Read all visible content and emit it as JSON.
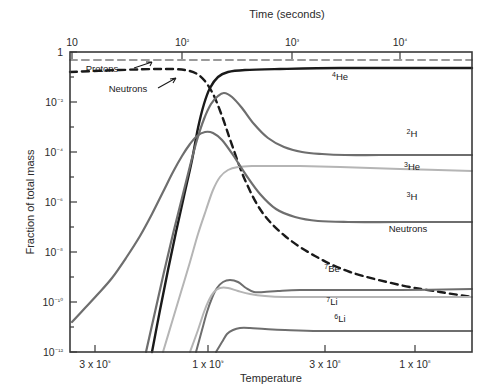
{
  "chart_data": {
    "type": "line",
    "title": "",
    "xlabel": "Temperature",
    "ylabel": "Fraction of total mass",
    "top_axis_label": "Time (seconds)",
    "grid": false,
    "legend": "inline-labels",
    "x_axis": {
      "scale": "log-reversed",
      "tick_labels": [
        "3 x 10⁹",
        "1 x 10⁹",
        "3 x 10⁸",
        "1 x 10⁸"
      ],
      "tick_values": [
        3000000000.0,
        1000000000.0,
        300000000.0,
        100000000.0
      ],
      "tick_px": [
        95,
        208,
        325,
        415
      ]
    },
    "top_axis": {
      "scale": "log",
      "tick_labels": [
        "10",
        "10²",
        "10³",
        "10⁴"
      ],
      "tick_values": [
        10,
        100,
        1000,
        10000
      ],
      "tick_px": [
        72,
        182,
        292,
        400
      ]
    },
    "y_axis": {
      "scale": "log",
      "tick_labels": [
        "1",
        "10⁻²",
        "10⁻⁴",
        "10⁻⁶",
        "10⁻⁸",
        "10⁻¹⁰",
        "10⁻¹²"
      ],
      "tick_values": [
        1,
        0.01,
        0.0001,
        1e-06,
        1e-08,
        1e-10,
        1e-12
      ],
      "ylim": [
        1e-12,
        1
      ]
    },
    "series": [
      {
        "name": "Protons",
        "label": "Protons",
        "color": "#9a9a9a",
        "style": "dashed",
        "width": 2.0,
        "final_value": 0.75,
        "points": [
          [
            0,
            60
          ],
          [
            492,
            60
          ]
        ]
      },
      {
        "name": "Neutrons",
        "label": "Neutrons",
        "color": "#1a1a1a",
        "style": "dashed",
        "width": 2.4,
        "final_value": 1e-10,
        "points": [
          [
            70,
            72
          ],
          [
            120,
            70
          ],
          [
            160,
            69
          ],
          [
            185,
            70
          ],
          [
            200,
            76
          ],
          [
            212,
            92
          ],
          [
            222,
            116
          ],
          [
            232,
            145
          ],
          [
            245,
            180
          ],
          [
            262,
            212
          ],
          [
            285,
            236
          ],
          [
            315,
            256
          ],
          [
            350,
            272
          ],
          [
            400,
            285
          ],
          [
            440,
            292
          ],
          [
            472,
            297
          ]
        ]
      },
      {
        "name": "4He",
        "label": "⁴He",
        "color": "#1a1a1a",
        "style": "solid",
        "width": 2.4,
        "final_value": 0.25,
        "points": [
          [
            152,
            352
          ],
          [
            160,
            310
          ],
          [
            168,
            270
          ],
          [
            176,
            232
          ],
          [
            184,
            196
          ],
          [
            192,
            160
          ],
          [
            198,
            128
          ],
          [
            204,
            104
          ],
          [
            210,
            88
          ],
          [
            218,
            77
          ],
          [
            228,
            72
          ],
          [
            245,
            70
          ],
          [
            280,
            69
          ],
          [
            340,
            68
          ],
          [
            420,
            68
          ],
          [
            472,
            68
          ]
        ]
      },
      {
        "name": "2H",
        "label": "²H",
        "color": "#6e6e6e",
        "style": "solid",
        "width": 2.2,
        "final_value": 3e-05,
        "points": [
          [
            146,
            352
          ],
          [
            155,
            312
          ],
          [
            164,
            272
          ],
          [
            173,
            234
          ],
          [
            182,
            198
          ],
          [
            190,
            166
          ],
          [
            197,
            140
          ],
          [
            204,
            119
          ],
          [
            211,
            104
          ],
          [
            218,
            96
          ],
          [
            224,
            93
          ],
          [
            232,
            97
          ],
          [
            242,
            108
          ],
          [
            254,
            124
          ],
          [
            268,
            138
          ],
          [
            284,
            147
          ],
          [
            302,
            152
          ],
          [
            322,
            154
          ],
          [
            345,
            155
          ],
          [
            380,
            155
          ],
          [
            430,
            155
          ],
          [
            472,
            155
          ]
        ]
      },
      {
        "name": "3He",
        "label": "³He",
        "color": "#b5b5b5",
        "style": "solid",
        "width": 2.0,
        "final_value": 1e-05,
        "points": [
          [
            163,
            352
          ],
          [
            172,
            322
          ],
          [
            181,
            292
          ],
          [
            190,
            262
          ],
          [
            198,
            234
          ],
          [
            206,
            210
          ],
          [
            213,
            190
          ],
          [
            220,
            177
          ],
          [
            228,
            170
          ],
          [
            238,
            167
          ],
          [
            252,
            166
          ],
          [
            272,
            166
          ],
          [
            300,
            166
          ],
          [
            340,
            167
          ],
          [
            400,
            169
          ],
          [
            472,
            171
          ]
        ]
      },
      {
        "name": "3H",
        "label": "³H",
        "color": "#6e6e6e",
        "style": "solid",
        "width": 2.2,
        "final_value": 2e-07,
        "points": [
          [
            72,
            322
          ],
          [
            85,
            308
          ],
          [
            98,
            294
          ],
          [
            112,
            278
          ],
          [
            126,
            258
          ],
          [
            140,
            236
          ],
          [
            152,
            214
          ],
          [
            163,
            192
          ],
          [
            173,
            172
          ],
          [
            182,
            156
          ],
          [
            190,
            144
          ],
          [
            197,
            136
          ],
          [
            205,
            132
          ],
          [
            213,
            133
          ],
          [
            222,
            140
          ],
          [
            233,
            155
          ],
          [
            246,
            175
          ],
          [
            260,
            194
          ],
          [
            276,
            209
          ],
          [
            295,
            217
          ],
          [
            318,
            221
          ],
          [
            348,
            222
          ],
          [
            400,
            222
          ],
          [
            472,
            222
          ]
        ]
      },
      {
        "name": "7Be",
        "label": "⁷Be",
        "color": "#6e6e6e",
        "style": "solid",
        "width": 2.0,
        "final_value": 1e-10,
        "points": [
          [
            196,
            352
          ],
          [
            202,
            330
          ],
          [
            207,
            312
          ],
          [
            212,
            298
          ],
          [
            217,
            288
          ],
          [
            223,
            282
          ],
          [
            230,
            280
          ],
          [
            238,
            282
          ],
          [
            246,
            288
          ],
          [
            254,
            292
          ],
          [
            264,
            292
          ],
          [
            278,
            291
          ],
          [
            300,
            290
          ],
          [
            340,
            290
          ],
          [
            400,
            290
          ],
          [
            472,
            289
          ]
        ]
      },
      {
        "name": "7Li",
        "label": "⁷Li",
        "color": "#b5b5b5",
        "style": "solid",
        "width": 2.0,
        "final_value": 6e-11,
        "points": [
          [
            190,
            352
          ],
          [
            198,
            330
          ],
          [
            204,
            312
          ],
          [
            209,
            300
          ],
          [
            214,
            292
          ],
          [
            220,
            288
          ],
          [
            228,
            288
          ],
          [
            238,
            291
          ],
          [
            250,
            294
          ],
          [
            265,
            296
          ],
          [
            285,
            297
          ],
          [
            320,
            297
          ],
          [
            380,
            297
          ],
          [
            472,
            297
          ]
        ]
      },
      {
        "name": "6Li",
        "label": "⁶Li",
        "color": "#6e6e6e",
        "style": "solid",
        "width": 2.0,
        "final_value": 1e-12,
        "points": [
          [
            216,
            352
          ],
          [
            222,
            342
          ],
          [
            227,
            334
          ],
          [
            233,
            330
          ],
          [
            240,
            328
          ],
          [
            250,
            328
          ],
          [
            265,
            329
          ],
          [
            285,
            330
          ],
          [
            320,
            331
          ],
          [
            380,
            331
          ],
          [
            472,
            331
          ]
        ]
      }
    ],
    "curve_labels": [
      {
        "text": "Protons",
        "x": 102,
        "y": 72,
        "leader": true
      },
      {
        "text": "Neutrons",
        "x": 128,
        "y": 92,
        "leader": true
      },
      {
        "text": "⁴He",
        "x": 340,
        "y": 80
      },
      {
        "text": "²H",
        "x": 412,
        "y": 137
      },
      {
        "text": "³He",
        "x": 412,
        "y": 170
      },
      {
        "text": "³H",
        "x": 412,
        "y": 200
      },
      {
        "text": "Neutrons",
        "x": 408,
        "y": 232
      },
      {
        "text": "⁷Be",
        "x": 332,
        "y": 272
      },
      {
        "text": "⁷Li",
        "x": 332,
        "y": 305
      },
      {
        "text": "⁶Li",
        "x": 340,
        "y": 322
      }
    ]
  },
  "figure": {
    "top_axis_title": "Time (seconds)",
    "bottom_axis_title": "Temperature",
    "left_axis_title": "Fraction of total mass"
  }
}
